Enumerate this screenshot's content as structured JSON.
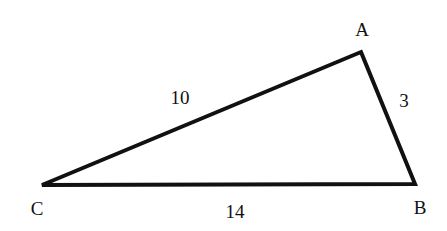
{
  "diagram": {
    "type": "triangle",
    "stroke_color": "#111111",
    "vertices": [
      {
        "label": "A",
        "x": 361,
        "y": 52,
        "lx": 362,
        "ly": 36
      },
      {
        "label": "B",
        "x": 415,
        "y": 184,
        "lx": 420,
        "ly": 214
      },
      {
        "label": "C",
        "x": 42,
        "y": 185,
        "lx": 37,
        "ly": 215
      }
    ],
    "sides": [
      {
        "between": "CA",
        "label": "10",
        "lx": 180,
        "ly": 104
      },
      {
        "between": "AB",
        "label": "3",
        "lx": 404,
        "ly": 107
      },
      {
        "between": "CB",
        "label": "14",
        "lx": 235,
        "ly": 218
      }
    ]
  }
}
